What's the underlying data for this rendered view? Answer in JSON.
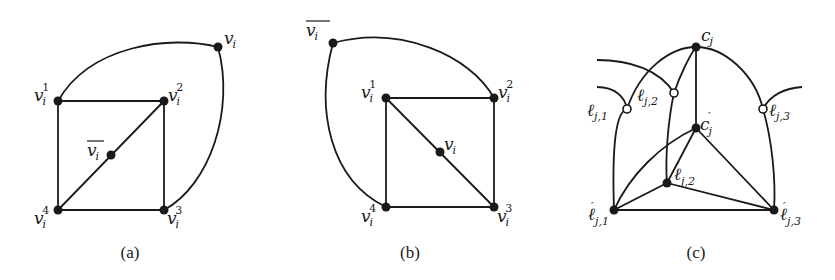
{
  "figure": {
    "panels": [
      {
        "caption": "(a)",
        "labels": {
          "v1": {
            "base": "v",
            "sub": "i",
            "sup": "1"
          },
          "v2": {
            "base": "v",
            "sub": "i",
            "sup": "2"
          },
          "v3": {
            "base": "v",
            "sub": "i",
            "sup": "3"
          },
          "v4": {
            "base": "v",
            "sub": "i",
            "sup": "4"
          },
          "vbar": {
            "base": "v",
            "sub": "i",
            "overline": true
          },
          "v": {
            "base": "v",
            "sub": "i"
          }
        }
      },
      {
        "caption": "(b)",
        "labels": {
          "v1": {
            "base": "v",
            "sub": "i",
            "sup": "1"
          },
          "v2": {
            "base": "v",
            "sub": "i",
            "sup": "2"
          },
          "v3": {
            "base": "v",
            "sub": "i",
            "sup": "3"
          },
          "v4": {
            "base": "v",
            "sub": "i",
            "sup": "4"
          },
          "vbar": {
            "base": "v",
            "sub": "i",
            "overline": true
          },
          "v": {
            "base": "v",
            "sub": "i"
          }
        }
      },
      {
        "caption": "(c)",
        "labels": {
          "c": {
            "base": "c",
            "sub": "j"
          },
          "cp": {
            "base": "c",
            "sub": "j",
            "sup": "′"
          },
          "l1": {
            "base": "ℓ",
            "sub": "j,1"
          },
          "l2": {
            "base": "ℓ",
            "sub": "j,2"
          },
          "l3": {
            "base": "ℓ",
            "sub": "j,3"
          },
          "lp1": {
            "base": "ℓ",
            "sub": "j,1",
            "sup": "′"
          },
          "lp2": {
            "base": "ℓ",
            "sub": "j,2",
            "sup": "′"
          },
          "lp3": {
            "base": "ℓ",
            "sub": "j,3",
            "sup": "′"
          }
        }
      }
    ]
  }
}
